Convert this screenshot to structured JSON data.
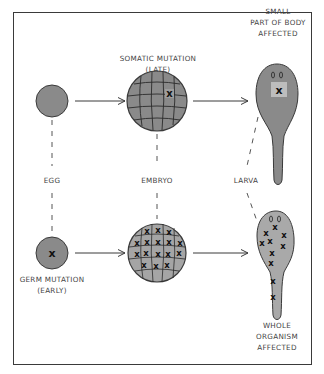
{
  "colors": {
    "cell_fill": "#8a8a8a",
    "larva_fill_whole": "#a9a9a9",
    "highlight_patch": "#bdbdbd",
    "outline": "#3a3a3a",
    "text": "#444444"
  },
  "labels": {
    "somatic_title": "SOMATIC MUTATION\n(LATE)",
    "small_part": "SMALL\nPART OF BODY\nAFFECTED",
    "egg": "EGG",
    "embryo": "EMBRYO",
    "larva": "LARVA",
    "germ_title": "GERM MUTATION\n(EARLY)",
    "whole_organism": "WHOLE\nORGANISM\nAFFECTED"
  },
  "rows": [
    {
      "name": "somatic",
      "stages": [
        "egg (unmutated)",
        "embryo with one mutated cell",
        "larva with small mutated patch"
      ]
    },
    {
      "name": "germ",
      "stages": [
        "egg with mutation",
        "embryo with all cells mutated",
        "larva with mutations throughout"
      ]
    }
  ],
  "marker": "X"
}
